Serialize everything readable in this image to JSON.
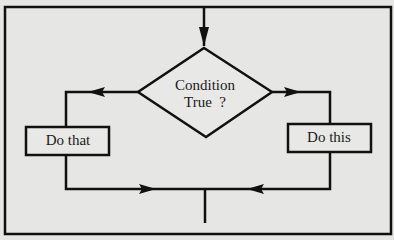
{
  "diagram": {
    "type": "flowchart",
    "title": "",
    "nodes": [
      {
        "id": "condition",
        "shape": "diamond",
        "label_line1": "Condition",
        "label_line2": "True  ?"
      },
      {
        "id": "do_that",
        "shape": "rectangle",
        "label": "Do that"
      },
      {
        "id": "do_this",
        "shape": "rectangle",
        "label": "Do this"
      }
    ],
    "edges": [
      {
        "from": "entry",
        "to": "condition",
        "direction": "down"
      },
      {
        "from": "condition",
        "to": "do_that",
        "side": "left",
        "branch": ""
      },
      {
        "from": "condition",
        "to": "do_this",
        "side": "right",
        "branch": ""
      },
      {
        "from": "do_that",
        "to": "merge"
      },
      {
        "from": "do_this",
        "to": "merge"
      },
      {
        "from": "merge",
        "to": "exit",
        "direction": "down"
      }
    ],
    "colors": {
      "stroke": "#111111",
      "background": "#e6e6e4",
      "box_fill": "#e8e8e6"
    }
  }
}
